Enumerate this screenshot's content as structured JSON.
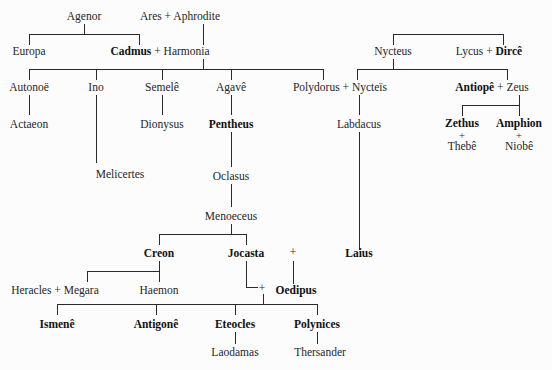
{
  "diagram": {
    "background": "#fcfcfc",
    "line_color": "#2a2a2a",
    "text_color": "#262626"
  },
  "people": {
    "agenor": "Agenor",
    "ares": "Ares",
    "aphrodite": "Aphrodite",
    "europa": "Europa",
    "cadmus": "Cadmus",
    "harmonia": "Harmonia",
    "autonoe": "Autonoë",
    "ino": "Ino",
    "semele": "Semelê",
    "agave": "Agavê",
    "polydorus": "Polydorus",
    "nycteis": "Nycteïs",
    "actaeon": "Actaeon",
    "dionysus": "Dionysus",
    "pentheus": "Pentheus",
    "labdacus": "Labdacus",
    "melicertes": "Melicertes",
    "oclasus": "Oclasus",
    "menoeceus": "Menoeceus",
    "creon": "Creon",
    "jocasta": "Jocasta",
    "laius": "Laius",
    "heracles": "Heracles",
    "megara": "Megara",
    "haemon": "Haemon",
    "oedipus": "Oedipus",
    "ismene": "Ismenê",
    "antigone": "Antigonê",
    "eteocles": "Eteocles",
    "polynices": "Polynices",
    "laodamas": "Laodamas",
    "thersander": "Thersander",
    "nycteus": "Nycteus",
    "lycus": "Lycus",
    "dirce": "Dircê",
    "antiope": "Antiopê",
    "zeus": "Zeus",
    "zethus": "Zethus",
    "amphion": "Amphion",
    "thebe": "Thebê",
    "niobe": "Niobê"
  },
  "symbols": {
    "union": "+"
  },
  "unions": {
    "ares_aphrodite": "Ares + Aphrodite",
    "cadmus_harmonia": "Cadmus + Harmonia",
    "polydorus_nycteis": "Polydorus + Nycteïs",
    "lycus_dirce": "Lycus + Dircê",
    "antiope_zeus": "Antiopê + Zeus",
    "heracles_megara": "Heracles + Megara",
    "jocasta_oedipus": "Jocasta + Oedipus",
    "zethus_thebe": "Zethus + Thebê",
    "amphion_niobe": "Amphion + Niobê"
  }
}
